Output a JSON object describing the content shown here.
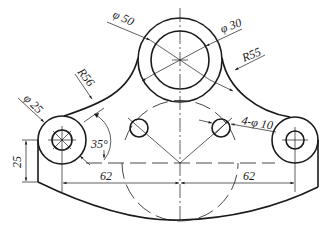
{
  "drawing": {
    "type": "mechanical-part-drawing",
    "dimensions": {
      "top_outer_diameter": "φ 50",
      "top_inner_diameter": "φ 30",
      "left_arc_radius": "R56",
      "right_arc_radius": "R55",
      "boss_diameter": "φ 25",
      "small_holes": "4-φ 10",
      "angle": "35°",
      "height": "25",
      "left_offset": "62",
      "right_offset": "62"
    },
    "colors": {
      "line": "#1a1a1a",
      "background": "#ffffff"
    }
  }
}
